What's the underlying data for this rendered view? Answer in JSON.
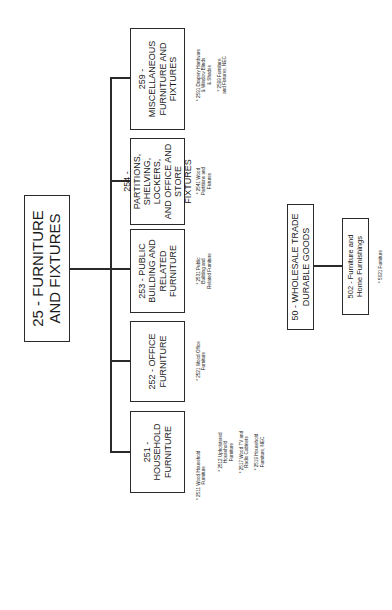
{
  "root": {
    "code": "25",
    "label": "25 - FURNITURE AND FIXTURES",
    "lines": [
      "25 - FURNITURE",
      "AND FIXTURES"
    ]
  },
  "children": [
    {
      "code": "251",
      "lines": [
        "251 - HOUSEHOLD",
        "FURNITURE"
      ],
      "items": [
        [
          "* 2511 Wood Household",
          "Furniture"
        ],
        [
          "* 2512 Upholstered",
          "Household",
          "Furniture"
        ],
        [
          "* 2517 Wood TV and",
          "Radio Cabinets"
        ],
        [
          "* 2519 Household",
          "Furniture, NEC"
        ]
      ]
    },
    {
      "code": "252",
      "lines": [
        "252 - OFFICE",
        "FURNITURE"
      ],
      "items": [
        [
          "* 2521 Wood Office",
          "Furniture"
        ]
      ]
    },
    {
      "code": "253",
      "lines": [
        "253 - PUBLIC",
        "BUILDING AND",
        "RELATED",
        "FURNITURE"
      ],
      "items": [
        [
          "* 2531 Public",
          "Building and",
          "Related Furniture"
        ]
      ]
    },
    {
      "code": "254",
      "lines": [
        "254 - PARTITIONS,",
        "SHELVING, LOCKERS,",
        "AND OFFICE AND",
        "STORE FIXTURES"
      ],
      "items": [
        [
          "* 2541 Wood",
          "Partitions and",
          "Fixtures"
        ]
      ]
    },
    {
      "code": "259",
      "lines": [
        "259 - MISCELLANEOUS",
        "FURNITURE AND",
        "FIXTURES"
      ],
      "items": [
        [
          "* 2591 Drapery Hardware",
          "& Window Blinds",
          "& Shades"
        ],
        [
          "* 2599 Furniture",
          "and Fixtures, NEC"
        ]
      ]
    }
  ],
  "wholesale": {
    "lines": [
      "50 - WHOLESALE TRADE",
      "DURABLE GOODS"
    ],
    "child": {
      "lines": [
        "502 - Furniture and",
        "Home Furnishings"
      ],
      "items": [
        [
          "* 5021 Furniture"
        ]
      ]
    }
  }
}
